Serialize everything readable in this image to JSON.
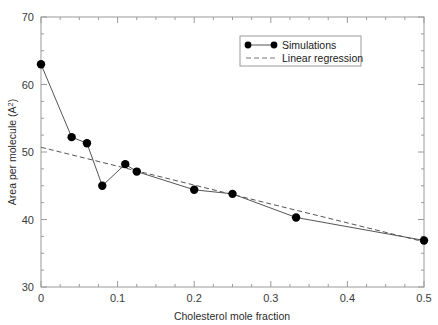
{
  "chart_data": {
    "type": "line",
    "title": "",
    "xlabel": "Cholesterol mole fraction",
    "ylabel": "Area per molecule (A",
    "ylabel_sup": "2",
    "ylabel_tail": ")",
    "xlim": [
      0,
      0.5
    ],
    "ylim": [
      30,
      70
    ],
    "xticks": [
      0,
      0.1,
      0.2,
      0.3,
      0.4,
      0.5
    ],
    "xtick_labels": [
      "0",
      "0.1",
      "0.2",
      "0.3",
      "0.4",
      "0.5"
    ],
    "yticks": [
      30,
      40,
      50,
      60,
      70
    ],
    "ytick_labels": [
      "30",
      "40",
      "50",
      "60",
      "70"
    ],
    "xminor_step": 0.025,
    "yminor_step": 2.5,
    "grid": false,
    "legend_position": "top-right",
    "series": [
      {
        "name": "Simulations",
        "style": "line-markers",
        "color": "#000000",
        "x": [
          0.0,
          0.04,
          0.06,
          0.08,
          0.11,
          0.125,
          0.2,
          0.25,
          0.333,
          0.5
        ],
        "values": [
          63.0,
          52.2,
          51.3,
          45.0,
          48.2,
          47.1,
          44.4,
          43.8,
          40.3,
          36.9
        ]
      },
      {
        "name": "Linear regression",
        "style": "dashed",
        "color": "#555555",
        "x": [
          0.0,
          0.5
        ],
        "values": [
          50.7,
          36.7
        ]
      }
    ]
  },
  "legend": {
    "entries": [
      {
        "label": "Simulations",
        "marker": "circle-line"
      },
      {
        "label": "Linear regression",
        "marker": "dashed-line"
      }
    ]
  }
}
